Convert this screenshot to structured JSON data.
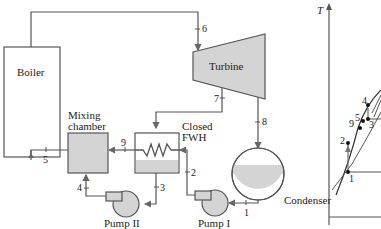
{
  "diagram": {
    "components": {
      "boiler": "Boiler",
      "turbine": "Turbine",
      "mixing_chamber_line1": "Mixing",
      "mixing_chamber_line2": "chamber",
      "closed_fwh_line1": "Closed",
      "closed_fwh_line2": "FWH",
      "condenser": "Condenser",
      "pump1": "Pump I",
      "pump2": "Pump II"
    },
    "states": [
      "1",
      "2",
      "3",
      "4",
      "5",
      "6",
      "7",
      "8",
      "9"
    ],
    "ts_diagram": {
      "y_axis_label": "T",
      "points": [
        "1",
        "2",
        "3",
        "4",
        "5",
        "9"
      ]
    },
    "colors": {
      "line": "#555555",
      "fill": "#d4d4d4",
      "text": "#222222"
    }
  }
}
